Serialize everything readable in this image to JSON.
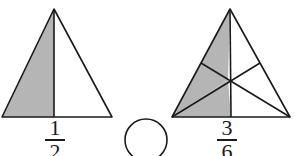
{
  "page": {
    "background_color": "#ffffff",
    "width": 295,
    "height": 156
  },
  "style": {
    "shade_color": "#b5b5b5",
    "line_color": "#1a1a1a",
    "unfilled_color": "#ffffff",
    "stroke_width": 1.6
  },
  "comparison": {
    "operator_placeholder": "",
    "blank_shape": "circle",
    "center_x": 146,
    "center_y": 140,
    "radius": 21
  },
  "figures": [
    {
      "id": "left-figure",
      "name": "triangle-halves",
      "shape": "triangle",
      "apex": [
        54,
        9
      ],
      "base_left": [
        2,
        117
      ],
      "base_right": [
        112,
        117
      ],
      "division": "vertical-median",
      "total_parts": 2,
      "shaded_parts": 1,
      "shaded_side": "left",
      "fraction": {
        "numerator": "1",
        "denominator": "2",
        "label": "1/2"
      }
    },
    {
      "id": "right-figure",
      "name": "triangle-sixths",
      "shape": "triangle",
      "apex": [
        230,
        9
      ],
      "base_left": [
        172,
        117
      ],
      "base_right": [
        290,
        117
      ],
      "division": "three-medians",
      "centroid": [
        228,
        80
      ],
      "midpoint_left_side": [
        201,
        63
      ],
      "midpoint_right_side": [
        260,
        63
      ],
      "midpoint_base": [
        231,
        117
      ],
      "total_parts": 6,
      "shaded_parts": 3,
      "shaded_regions": [
        "upper-left",
        "lower-left",
        "bottom-left-of-median"
      ],
      "fraction": {
        "numerator": "3",
        "denominator": "6",
        "label": "3/6"
      }
    }
  ]
}
